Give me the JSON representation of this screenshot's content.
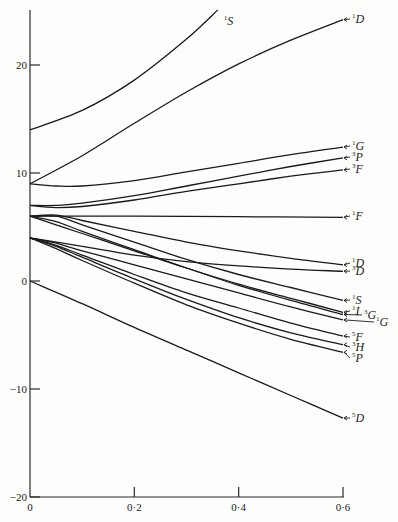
{
  "chart_data": {
    "type": "line",
    "title": "",
    "xlabel": "",
    "ylabel": "",
    "xlim": [
      0,
      0.6
    ],
    "ylim": [
      -20,
      25
    ],
    "x_ticks": [
      {
        "value": 0,
        "label": "0"
      },
      {
        "value": 0.2,
        "label": "0·2"
      },
      {
        "value": 0.4,
        "label": "0·4"
      },
      {
        "value": 0.6,
        "label": "0·6"
      }
    ],
    "y_ticks": [
      {
        "value": 20,
        "label": "20"
      },
      {
        "value": 10,
        "label": "10"
      },
      {
        "value": 0,
        "label": "0"
      },
      {
        "value": -10,
        "label": "−10"
      },
      {
        "value": -20,
        "label": "−20"
      }
    ],
    "grid": false,
    "series": [
      {
        "name": "1S (upper)",
        "mult": "1",
        "letter": "S",
        "label_pos": "end-inline",
        "points": [
          [
            0,
            14
          ],
          [
            0.1,
            15.8
          ],
          [
            0.2,
            18.6
          ],
          [
            0.3,
            22.4
          ],
          [
            0.36,
            25.1
          ]
        ]
      },
      {
        "name": "1D (upper)",
        "mult": "1",
        "letter": "D",
        "points": [
          [
            0,
            9
          ],
          [
            0.1,
            11.6
          ],
          [
            0.2,
            14.6
          ],
          [
            0.3,
            17.5
          ],
          [
            0.4,
            20.1
          ],
          [
            0.5,
            22.3
          ],
          [
            0.6,
            24.2
          ]
        ]
      },
      {
        "name": "1G",
        "mult": "1",
        "letter": "G",
        "points": [
          [
            0,
            9
          ],
          [
            0.05,
            8.8
          ],
          [
            0.1,
            8.8
          ],
          [
            0.2,
            9.3
          ],
          [
            0.3,
            10.1
          ],
          [
            0.4,
            10.9
          ],
          [
            0.5,
            11.7
          ],
          [
            0.6,
            12.4
          ]
        ]
      },
      {
        "name": "3P (upper)",
        "mult": "3",
        "letter": "P",
        "points": [
          [
            0,
            7
          ],
          [
            0.05,
            7
          ],
          [
            0.1,
            7.2
          ],
          [
            0.2,
            7.9
          ],
          [
            0.3,
            8.8
          ],
          [
            0.4,
            9.7
          ],
          [
            0.5,
            10.6
          ],
          [
            0.6,
            11.4
          ]
        ]
      },
      {
        "name": "3F (upper)",
        "mult": "3",
        "letter": "F",
        "points": [
          [
            0,
            7
          ],
          [
            0.05,
            6.8
          ],
          [
            0.1,
            6.9
          ],
          [
            0.2,
            7.5
          ],
          [
            0.3,
            8.3
          ],
          [
            0.4,
            9.0
          ],
          [
            0.5,
            9.7
          ],
          [
            0.6,
            10.3
          ]
        ]
      },
      {
        "name": "1F",
        "mult": "1",
        "letter": "F",
        "points": [
          [
            0,
            6
          ],
          [
            0.2,
            6
          ],
          [
            0.4,
            5.95
          ],
          [
            0.6,
            5.9
          ]
        ]
      },
      {
        "name": "1D (lower)",
        "mult": "1",
        "letter": "D",
        "points": [
          [
            0,
            6
          ],
          [
            0.05,
            6.1
          ],
          [
            0.1,
            5.6
          ],
          [
            0.2,
            4.6
          ],
          [
            0.3,
            3.6
          ],
          [
            0.4,
            2.8
          ],
          [
            0.5,
            2.1
          ],
          [
            0.6,
            1.5
          ]
        ]
      },
      {
        "name": "3D",
        "mult": "3",
        "letter": "D",
        "points": [
          [
            0,
            4
          ],
          [
            0.1,
            3.2
          ],
          [
            0.2,
            2.4
          ],
          [
            0.3,
            1.8
          ],
          [
            0.4,
            1.4
          ],
          [
            0.5,
            1.1
          ],
          [
            0.6,
            0.9
          ]
        ]
      },
      {
        "name": "1S (lower)",
        "mult": "1",
        "letter": "S",
        "points": [
          [
            0,
            6
          ],
          [
            0.05,
            6.0
          ],
          [
            0.1,
            5.2
          ],
          [
            0.2,
            3.6
          ],
          [
            0.3,
            2.0
          ],
          [
            0.4,
            0.6
          ],
          [
            0.5,
            -0.6
          ],
          [
            0.6,
            -1.8
          ]
        ]
      },
      {
        "name": "1I",
        "mult": "1",
        "letter": "I",
        "points": [
          [
            0,
            6
          ],
          [
            0.1,
            4.4
          ],
          [
            0.2,
            2.8
          ],
          [
            0.3,
            1.2
          ],
          [
            0.4,
            -0.3
          ],
          [
            0.5,
            -1.6
          ],
          [
            0.6,
            -2.9
          ]
        ]
      },
      {
        "name": "3G",
        "mult": "3",
        "letter": "G",
        "points": [
          [
            0,
            6
          ],
          [
            0.05,
            5.5
          ],
          [
            0.1,
            4.6
          ],
          [
            0.2,
            2.9
          ],
          [
            0.3,
            1.2
          ],
          [
            0.4,
            -0.4
          ],
          [
            0.5,
            -1.8
          ],
          [
            0.6,
            -3.1
          ]
        ]
      },
      {
        "name": "1G (lower)",
        "mult": "1",
        "letter": "G",
        "points": [
          [
            0,
            4
          ],
          [
            0.05,
            3.5
          ],
          [
            0.1,
            2.8
          ],
          [
            0.2,
            1.5
          ],
          [
            0.3,
            0.2
          ],
          [
            0.4,
            -1.1
          ],
          [
            0.5,
            -2.4
          ],
          [
            0.6,
            -3.6
          ]
        ]
      },
      {
        "name": "5F",
        "mult": "5",
        "letter": "F",
        "points": [
          [
            0,
            4
          ],
          [
            0.05,
            3.3
          ],
          [
            0.1,
            2.4
          ],
          [
            0.2,
            0.6
          ],
          [
            0.3,
            -1.1
          ],
          [
            0.4,
            -2.5
          ],
          [
            0.5,
            -3.9
          ],
          [
            0.6,
            -5.1
          ]
        ]
      },
      {
        "name": "3H",
        "mult": "3",
        "letter": "H",
        "points": [
          [
            0,
            4
          ],
          [
            0.05,
            3.2
          ],
          [
            0.1,
            2.2
          ],
          [
            0.2,
            0.2
          ],
          [
            0.3,
            -1.7
          ],
          [
            0.4,
            -3.4
          ],
          [
            0.5,
            -4.8
          ],
          [
            0.6,
            -5.9
          ]
        ]
      },
      {
        "name": "5P",
        "mult": "5",
        "letter": "P",
        "points": [
          [
            0,
            4
          ],
          [
            0.05,
            3.0
          ],
          [
            0.1,
            1.9
          ],
          [
            0.2,
            -0.2
          ],
          [
            0.3,
            -2.2
          ],
          [
            0.4,
            -3.9
          ],
          [
            0.5,
            -5.4
          ],
          [
            0.6,
            -6.6
          ]
        ]
      },
      {
        "name": "5D",
        "mult": "5",
        "letter": "D",
        "points": [
          [
            0,
            0
          ],
          [
            0.1,
            -2.1
          ],
          [
            0.2,
            -4.3
          ],
          [
            0.3,
            -6.4
          ],
          [
            0.4,
            -8.5
          ],
          [
            0.5,
            -10.6
          ],
          [
            0.6,
            -12.7
          ]
        ]
      }
    ]
  }
}
